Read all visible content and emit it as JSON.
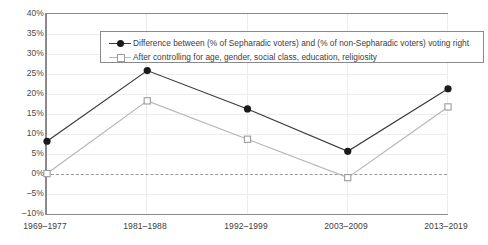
{
  "chart_data": {
    "type": "line",
    "title": "",
    "subtitle": "",
    "xlabel": "",
    "ylabel": "",
    "categories": [
      "1969–1977",
      "1981–1988",
      "1992–1999",
      "2003–2009",
      "2013–2019"
    ],
    "ylim": [
      -10,
      40
    ],
    "ytick_values": [
      40,
      35,
      30,
      25,
      20,
      15,
      10,
      5,
      0,
      -5,
      -10
    ],
    "ytick_labels": [
      "40%",
      "35%",
      "30%",
      "25%",
      "20%",
      "15%",
      "10%",
      "5%",
      "0%",
      "–5%",
      "–10%"
    ],
    "grid": true,
    "grid_axis": "both",
    "zero_reference_line": true,
    "zero_reference_style": "dashed",
    "legend_position": "top-inside",
    "series": [
      {
        "name": "Difference between (% of Sepharadic voters) and (% of non-Sepharadic voters) voting right",
        "values": [
          8.5,
          26.0,
          16.5,
          6.0,
          21.5
        ],
        "marker": "filled-circle",
        "color": "#1a1a1a",
        "line_color": "#3a3a3a"
      },
      {
        "name": "After controlling for age, gender, social class, education, religiosity",
        "values": [
          0.5,
          18.5,
          9.0,
          -0.5,
          17.0
        ],
        "marker": "open-square",
        "color": "#ffffff",
        "line_color": "#b6b6b6"
      }
    ]
  },
  "legend": {
    "items": [
      {
        "label": "Difference between (% of Sepharadic voters) and (% of non-Sepharadic voters) voting right",
        "marker": "filled-circle-line"
      },
      {
        "label": "After controlling for age, gender, social class, education, religiosity",
        "marker": "open-square-line"
      }
    ]
  },
  "axes": {
    "y_labels": [
      "40%",
      "35%",
      "30%",
      "25%",
      "20%",
      "15%",
      "10%",
      "5%",
      "0%",
      "–5%",
      "–10%"
    ],
    "x_labels": [
      "1969–1977",
      "1981–1988",
      "1992–1999",
      "2003–2009",
      "2013–2019"
    ]
  },
  "colors": {
    "series1": "#1a1a1a",
    "series2": "#b6b6b6",
    "grid": "#ededed",
    "frame": "#8a8a8a",
    "zero_line": "#9a9a9a",
    "text": "#3c3c3c",
    "background": "#ffffff"
  }
}
